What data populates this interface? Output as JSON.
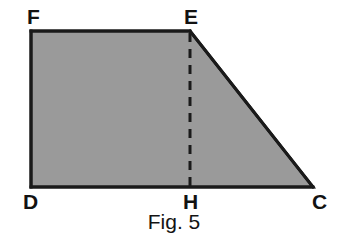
{
  "figure": {
    "caption": "Fig. 5",
    "shape_name": "right-trapezoid",
    "fill_color": "#9a9a9a",
    "stroke_color": "#1a1a1a",
    "background_color": "#ffffff",
    "stroke_width": 3,
    "dashed_stroke_width": 3,
    "dash_pattern": "9,7"
  },
  "vertices": {
    "F": {
      "label": "F",
      "x": 31,
      "y": 31
    },
    "E": {
      "label": "E",
      "x": 190,
      "y": 31
    },
    "C": {
      "label": "C",
      "x": 313,
      "y": 187
    },
    "D": {
      "label": "D",
      "x": 31,
      "y": 187
    },
    "H": {
      "label": "H",
      "x": 190,
      "y": 187
    }
  },
  "polygon": {
    "points": "31,31 190,31 313,187 31,187",
    "order": [
      "F",
      "E",
      "C",
      "D"
    ]
  },
  "segments": [
    {
      "name": "FE",
      "from": "F",
      "to": "E",
      "style": "solid"
    },
    {
      "name": "EC",
      "from": "E",
      "to": "C",
      "style": "solid"
    },
    {
      "name": "CD",
      "from": "C",
      "to": "D",
      "style": "solid"
    },
    {
      "name": "DF",
      "from": "D",
      "to": "F",
      "style": "solid"
    },
    {
      "name": "EH",
      "from": "E",
      "to": "H",
      "style": "dashed"
    }
  ]
}
